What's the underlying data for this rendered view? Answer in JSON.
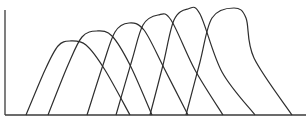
{
  "chart_data": {
    "type": "line",
    "title": "",
    "xlabel": "",
    "ylabel": "",
    "grid": false,
    "legend": null,
    "axis_pixels": {
      "origin": [
        5,
        115
      ],
      "x_end": 306,
      "y_top": 10
    },
    "series": [
      {
        "name": "curve-1",
        "points": [
          [
            26,
            115
          ],
          [
            45,
            70
          ],
          [
            58,
            46
          ],
          [
            70,
            41
          ],
          [
            86,
            45
          ],
          [
            105,
            70
          ],
          [
            130,
            115
          ]
        ]
      },
      {
        "name": "curve-2",
        "points": [
          [
            48,
            115
          ],
          [
            68,
            65
          ],
          [
            82,
            37
          ],
          [
            97,
            31
          ],
          [
            112,
            36
          ],
          [
            130,
            65
          ],
          [
            152,
            115
          ]
        ]
      },
      {
        "name": "curve-3",
        "points": [
          [
            87,
            115
          ],
          [
            103,
            65
          ],
          [
            115,
            32
          ],
          [
            129,
            23
          ],
          [
            144,
            30
          ],
          [
            164,
            68
          ],
          [
            188,
            115
          ]
        ]
      },
      {
        "name": "curve-4",
        "points": [
          [
            116,
            115
          ],
          [
            132,
            60
          ],
          [
            143,
            25
          ],
          [
            158,
            15
          ],
          [
            171,
            20
          ],
          [
            195,
            70
          ],
          [
            223,
            115
          ]
        ]
      },
      {
        "name": "curve-5",
        "points": [
          [
            150,
            115
          ],
          [
            163,
            65
          ],
          [
            174,
            20
          ],
          [
            188,
            9
          ],
          [
            200,
            14
          ],
          [
            222,
            72
          ],
          [
            255,
            115
          ]
        ]
      },
      {
        "name": "curve-6",
        "points": [
          [
            186,
            115
          ],
          [
            200,
            62
          ],
          [
            212,
            18
          ],
          [
            234,
            8
          ],
          [
            246,
            18
          ],
          [
            254,
            58
          ],
          [
            292,
            115
          ]
        ]
      }
    ]
  }
}
